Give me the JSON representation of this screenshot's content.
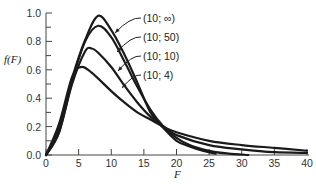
{
  "chart_data": {
    "type": "line",
    "title": "",
    "xlabel": "F",
    "ylabel": "f(F)",
    "xlim": [
      0,
      40
    ],
    "ylim": [
      0,
      1.0
    ],
    "grid": false,
    "x_ticks": [
      "0",
      "5",
      "10",
      "15",
      "20",
      "25",
      "30",
      "35",
      "40"
    ],
    "y_ticks": [
      "0.0",
      "0.2",
      "0.4",
      "0.6",
      "0.8",
      "1.0"
    ],
    "legend_position": "annotated arrows, upper middle",
    "series": [
      {
        "name": "(10; ∞)",
        "nu1": 10,
        "nu2": null,
        "peak_x": 8.0,
        "peak_y": 0.98,
        "x_end": 26,
        "points": [
          [
            0,
            0
          ],
          [
            2,
            0.19
          ],
          [
            4,
            0.54
          ],
          [
            6,
            0.81
          ],
          [
            8,
            0.98
          ],
          [
            10,
            0.88
          ],
          [
            12,
            0.71
          ],
          [
            14,
            0.51
          ],
          [
            16,
            0.3
          ],
          [
            18,
            0.19
          ],
          [
            20,
            0.1
          ],
          [
            22,
            0.06
          ],
          [
            24,
            0.03
          ],
          [
            26,
            0.01
          ]
        ]
      },
      {
        "name": "(10; 50)",
        "nu1": 10,
        "nu2": 50,
        "peak_x": 7.8,
        "peak_y": 0.91,
        "x_end": 31,
        "points": [
          [
            0,
            0
          ],
          [
            2,
            0.16
          ],
          [
            4,
            0.52
          ],
          [
            6,
            0.8
          ],
          [
            8,
            0.91
          ],
          [
            10,
            0.83
          ],
          [
            12,
            0.66
          ],
          [
            14,
            0.48
          ],
          [
            16,
            0.32
          ],
          [
            18,
            0.2
          ],
          [
            20,
            0.12
          ],
          [
            22,
            0.07
          ],
          [
            24,
            0.04
          ],
          [
            26,
            0.02
          ],
          [
            28,
            0.01
          ],
          [
            31,
            0.0
          ]
        ]
      },
      {
        "name": "(10; 10)",
        "nu1": 10,
        "nu2": 10,
        "peak_x": 6.7,
        "peak_y": 0.75,
        "x_end": 40,
        "points": [
          [
            0,
            0
          ],
          [
            2,
            0.16
          ],
          [
            4,
            0.5
          ],
          [
            6,
            0.73
          ],
          [
            7,
            0.75
          ],
          [
            8,
            0.72
          ],
          [
            10,
            0.62
          ],
          [
            12,
            0.49
          ],
          [
            14,
            0.37
          ],
          [
            16,
            0.27
          ],
          [
            18,
            0.2
          ],
          [
            20,
            0.14
          ],
          [
            25,
            0.07
          ],
          [
            30,
            0.04
          ],
          [
            35,
            0.02
          ],
          [
            40,
            0.015
          ]
        ]
      },
      {
        "name": "(10; 4)",
        "nu1": 10,
        "nu2": 4,
        "peak_x": 5.4,
        "peak_y": 0.62,
        "x_end": 40,
        "points": [
          [
            0,
            0
          ],
          [
            2,
            0.22
          ],
          [
            4,
            0.55
          ],
          [
            5.4,
            0.62
          ],
          [
            7,
            0.58
          ],
          [
            10,
            0.45
          ],
          [
            12,
            0.37
          ],
          [
            14,
            0.3
          ],
          [
            16,
            0.25
          ],
          [
            18,
            0.2
          ],
          [
            20,
            0.16
          ],
          [
            25,
            0.1
          ],
          [
            30,
            0.07
          ],
          [
            35,
            0.05
          ],
          [
            40,
            0.03
          ]
        ]
      }
    ]
  }
}
